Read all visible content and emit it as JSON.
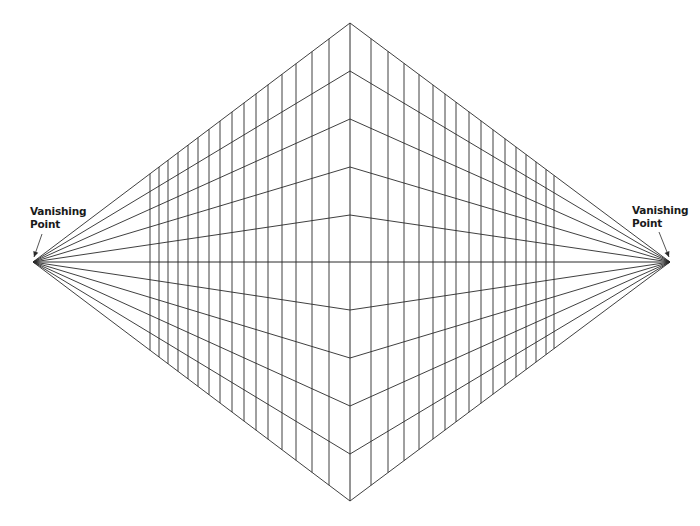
{
  "diagram": {
    "type": "two-point-perspective-grid",
    "colors": {
      "background": "#ffffff",
      "line": "#2a2a2a",
      "text": "#1a1a1a"
    },
    "vanishing_points": {
      "left": {
        "x": 33,
        "y": 262
      },
      "right": {
        "x": 670,
        "y": 262
      }
    },
    "center_line_x": 350,
    "center_points_y": [
      23,
      71,
      119,
      167,
      215,
      262,
      310,
      358,
      406,
      454,
      501
    ],
    "horizon_y": 262,
    "vertical_lines_x": {
      "left": [
        150,
        159,
        168,
        178,
        188,
        198,
        209,
        220,
        232,
        244,
        256,
        268,
        282,
        296,
        312,
        329
      ],
      "right": [
        371,
        388,
        404,
        419,
        433,
        445,
        456,
        469,
        481,
        493,
        505,
        516,
        526,
        536,
        546,
        554
      ]
    },
    "labels": {
      "left": {
        "line1": "Vanishing",
        "line2": "Point",
        "x": 30,
        "y": 205
      },
      "right": {
        "line1": "Vanishing",
        "line2": "Point",
        "x": 632,
        "y": 204
      }
    },
    "arrows": {
      "left": {
        "x1": 42,
        "y1": 234,
        "x2": 34,
        "y2": 257
      },
      "right": {
        "x1": 659,
        "y1": 232,
        "x2": 669,
        "y2": 257
      }
    }
  }
}
